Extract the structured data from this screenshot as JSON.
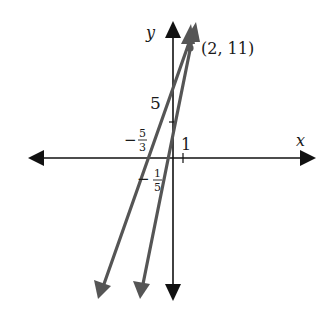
{
  "figure": {
    "axes": {
      "x_label": "x",
      "y_label": "y",
      "color": "#111111"
    },
    "lines": [
      {
        "name": "line-a",
        "description": "Line through (2, 11) with x-intercept -5/3",
        "x_intercept_label_num": "5",
        "x_intercept_label_den": "3",
        "x_intercept_label_sign": "−",
        "color": "#555555"
      },
      {
        "name": "line-b",
        "description": "Line through (2, 11) with x-intercept -1/5",
        "x_intercept_label_num": "1",
        "x_intercept_label_den": "5",
        "x_intercept_label_sign": "−",
        "color": "#555555"
      }
    ],
    "intersection_point": {
      "label": "(2, 11)",
      "x": 2,
      "y": 11,
      "color": "#555555"
    },
    "tick_labels": {
      "y_tick": "5",
      "x_tick": "1"
    }
  }
}
